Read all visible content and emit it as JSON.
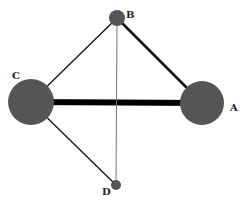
{
  "diagram": {
    "type": "network-graph",
    "nodes": [
      {
        "id": "A",
        "label": "A",
        "x": 202,
        "y": 103,
        "r": 22,
        "lx": 230,
        "ly": 111
      },
      {
        "id": "B",
        "label": "B",
        "x": 117,
        "y": 18,
        "r": 8,
        "lx": 126,
        "ly": 18
      },
      {
        "id": "C",
        "label": "C",
        "x": 31,
        "y": 102,
        "r": 23,
        "lx": 12,
        "ly": 79
      },
      {
        "id": "D",
        "label": "D",
        "x": 116,
        "y": 185,
        "r": 5,
        "lx": 102,
        "ly": 195
      }
    ],
    "edges": [
      {
        "from": "C",
        "to": "A",
        "width": 6,
        "color": "#000000"
      },
      {
        "from": "B",
        "to": "A",
        "width": 2.5,
        "color": "#000000"
      },
      {
        "from": "B",
        "to": "C",
        "width": 1.3,
        "color": "#111111"
      },
      {
        "from": "C",
        "to": "D",
        "width": 1.3,
        "color": "#111111"
      },
      {
        "from": "B",
        "to": "D",
        "width": 1,
        "color": "#777777"
      }
    ],
    "node_color": "#555555"
  }
}
